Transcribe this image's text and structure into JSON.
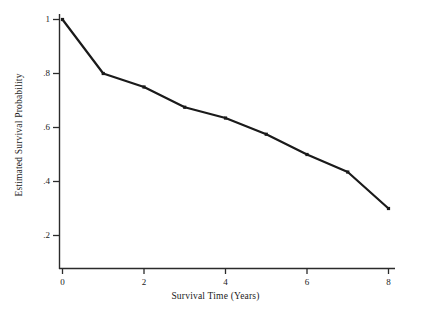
{
  "chart_data": {
    "type": "line",
    "title": "",
    "xlabel": "Survival Time (Years)",
    "ylabel": "Estimated Survival Probability",
    "x": [
      0,
      1,
      2,
      3,
      4,
      5,
      6,
      7,
      8
    ],
    "values": [
      1.0,
      0.8,
      0.75,
      0.675,
      0.635,
      0.575,
      0.5,
      0.435,
      0.3
    ],
    "series": [
      {
        "name": "Estimated Survival Probability",
        "values": [
          1.0,
          0.8,
          0.75,
          0.675,
          0.635,
          0.575,
          0.5,
          0.435,
          0.3
        ]
      }
    ],
    "xlim": [
      0,
      8
    ],
    "ylim": [
      0,
      1.0
    ],
    "xticks": [
      0,
      2,
      4,
      6,
      8
    ],
    "xtick_labels": [
      "0",
      "2",
      "4",
      "6",
      "8"
    ],
    "yticks": [
      0.2,
      0.4,
      0.6,
      0.8,
      1.0
    ],
    "ytick_labels": [
      ".2",
      ".4",
      ".6",
      ".8",
      "1"
    ],
    "grid": false,
    "legend": "none",
    "marker": "point",
    "line_color": "#1a1a1a",
    "line_width": 2.2,
    "axis_color": "#2b2b2b"
  },
  "axes": {
    "x_title": "Survival Time (Years)",
    "y_title": "Estimated Survival Probability"
  }
}
